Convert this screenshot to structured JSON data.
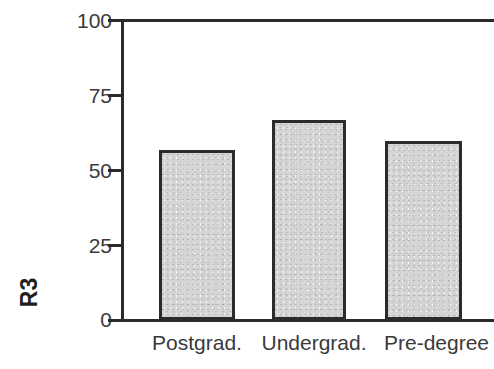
{
  "chart_data": {
    "type": "bar",
    "title": "",
    "subtitle": "",
    "xlabel": "",
    "ylabel": "R3",
    "categories": [
      "Postgrad.",
      "Undergrad.",
      "Pre-degree"
    ],
    "values": [
      57,
      67,
      60
    ],
    "series": [
      {
        "name": "R3",
        "values": [
          57,
          67,
          60
        ]
      }
    ],
    "ylim": [
      0,
      100
    ],
    "y_ticks": [
      0,
      25,
      50,
      75,
      100
    ],
    "y_tick_labels": [
      "0",
      "25",
      "50",
      "75",
      "100"
    ],
    "x_tick_labels": [
      "Postgrad.",
      "Undergrad.",
      "Pre-degree"
    ],
    "grid": false,
    "legend": false,
    "legend_position": "none",
    "annotations": [],
    "colors": {
      "bar_fill": "#d5d5d5",
      "bar_border": "#2b2b2b",
      "axis": "#2b2b2b",
      "tick_label": "#3a3a3a",
      "axis_title": "#231f20",
      "background": "#ffffff"
    }
  },
  "axis": {
    "y_title": "R3",
    "ticks": [
      {
        "label": "100",
        "value": 100
      },
      {
        "label": "75",
        "value": 75
      },
      {
        "label": "50",
        "value": 50
      },
      {
        "label": "25",
        "value": 25
      },
      {
        "label": "0",
        "value": 0
      }
    ]
  },
  "bars": [
    {
      "label": "Postgrad.",
      "value": 57
    },
    {
      "label": "Undergrad.",
      "value": 67
    },
    {
      "label": "Pre-degree",
      "value": 60
    }
  ]
}
